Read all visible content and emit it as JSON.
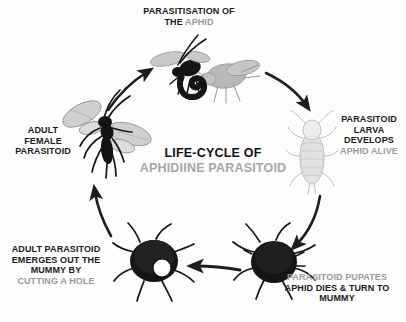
{
  "diagram": {
    "title_line1": "LIFE-CYCLE OF",
    "title_line2": "APHIDIINE PARASITOID",
    "background_color": "#fdfdfd",
    "text_color": "#1a1a1a",
    "highlight_color": "#9a9a9a",
    "layout": "circular clockwise cycle with five stages and five curved arrows"
  },
  "stages": [
    {
      "id": "parasitisation",
      "position": "top",
      "label_lines": [
        {
          "text": "PARASITISATION OF",
          "color": "dark"
        },
        {
          "text": "THE ",
          "color": "dark",
          "text2": "APHID",
          "color2": "grey"
        }
      ],
      "label_line1": "PARASITISATION OF",
      "label_line2_dark": "THE ",
      "label_line2_grey": "APHID",
      "art_name": "wasp-stinging-aphid-illustration"
    },
    {
      "id": "larva-develops",
      "position": "right",
      "label_line1": "PARASITOID",
      "label_line2": "LARVA",
      "label_line3": "DEVELOPS",
      "label_line4_grey": "APHID ALIVE",
      "art_name": "live-aphid-outline-illustration"
    },
    {
      "id": "pupates",
      "position": "bottom-right",
      "label_line1_grey": "PARASITOID PUPATES",
      "label_line2": "APHID DIES & TURN TO",
      "label_line3": "MUMMY",
      "art_name": "aphid-mummy-illustration"
    },
    {
      "id": "emerges",
      "position": "bottom-left",
      "label_line1": "ADULT PARASITOID",
      "label_line2": "EMERGES OUT THE",
      "label_line3": "MUMMY BY",
      "label_line4_grey": "CUTTING A HOLE",
      "art_name": "aphid-mummy-with-exit-hole-illustration"
    },
    {
      "id": "adult-female",
      "position": "left",
      "label_line1": "ADULT",
      "label_line2": "FEMALE",
      "label_line3": "PARASITOID",
      "art_name": "adult-female-wasp-illustration"
    }
  ],
  "arrows": [
    {
      "id": "arrow-adult-to-parasitisation",
      "from": "adult-female",
      "to": "parasitisation",
      "direction": "up-right"
    },
    {
      "id": "arrow-parasitisation-to-larva",
      "from": "parasitisation",
      "to": "larva-develops",
      "direction": "down-right"
    },
    {
      "id": "arrow-larva-to-pupates",
      "from": "larva-develops",
      "to": "pupates",
      "direction": "down-left"
    },
    {
      "id": "arrow-pupates-to-emerges",
      "from": "pupates",
      "to": "emerges",
      "direction": "left"
    },
    {
      "id": "arrow-emerges-to-adult",
      "from": "emerges",
      "to": "adult-female",
      "direction": "up"
    }
  ]
}
